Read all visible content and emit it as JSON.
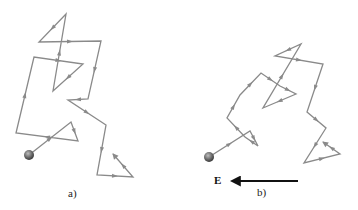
{
  "panels": [
    {
      "label": "a)",
      "description": "random walk path of a particle without field",
      "path_color": "#8a8a8a",
      "ball_color": "#555555",
      "ball": [
        29,
        155
      ],
      "points": [
        [
          29,
          155
        ],
        [
          71,
          122
        ],
        [
          78,
          141
        ],
        [
          16,
          133
        ],
        [
          34,
          57
        ],
        [
          83,
          64
        ],
        [
          53,
          91
        ],
        [
          66,
          14
        ],
        [
          39,
          42
        ],
        [
          101,
          41
        ],
        [
          88,
          99
        ],
        [
          68,
          100
        ],
        [
          106,
          125
        ],
        [
          97,
          175
        ],
        [
          133,
          177
        ],
        [
          113,
          154
        ]
      ]
    },
    {
      "label": "b)",
      "description": "random walk path of a particle with drift in electric field E",
      "path_color": "#8a8a8a",
      "ball_color": "#555555",
      "ball": [
        209,
        157
      ],
      "points": [
        [
          209,
          157
        ],
        [
          250,
          131
        ],
        [
          258,
          146
        ],
        [
          245,
          137
        ],
        [
          227,
          118
        ],
        [
          240,
          95
        ],
        [
          261,
          73
        ],
        [
          280,
          86
        ],
        [
          296,
          94
        ],
        [
          263,
          108
        ],
        [
          301,
          44
        ],
        [
          275,
          56
        ],
        [
          323,
          64
        ],
        [
          307,
          112
        ],
        [
          326,
          128
        ],
        [
          304,
          163
        ],
        [
          340,
          154
        ],
        [
          323,
          142
        ]
      ]
    }
  ],
  "field": {
    "label": "E",
    "direction": "left",
    "from": [
      298,
      181
    ],
    "to": [
      232,
      181
    ]
  }
}
